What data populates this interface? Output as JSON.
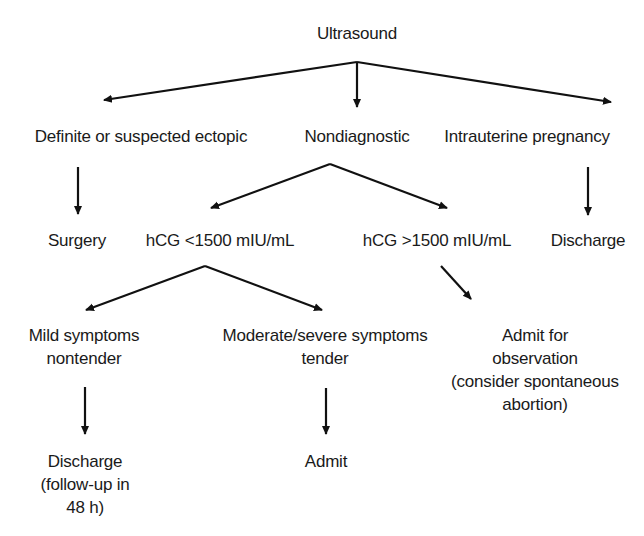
{
  "diagram": {
    "type": "flowchart",
    "nodes": {
      "ultrasound": {
        "label": "Ultrasound"
      },
      "ectopic": {
        "label": "Definite or suspected ectopic"
      },
      "nondiagnostic": {
        "label": "Nondiagnostic"
      },
      "intrauterine": {
        "label": "Intrauterine pregnancy"
      },
      "surgery": {
        "label": "Surgery"
      },
      "hcg_low": {
        "label": "hCG <1500 mIU/mL"
      },
      "hcg_high": {
        "label": "hCG >1500 mIU/mL"
      },
      "discharge_iup": {
        "label": "Discharge"
      },
      "mild": {
        "lines": [
          "Mild symptoms",
          "nontender"
        ]
      },
      "moderate": {
        "lines": [
          "Moderate/severe symptoms",
          "tender"
        ]
      },
      "admit_obs": {
        "lines": [
          "Admit for",
          "observation",
          "(consider spontaneous",
          "abortion)"
        ]
      },
      "discharge_followup": {
        "lines": [
          "Discharge",
          "(follow-up in",
          "48 h)"
        ]
      },
      "admit": {
        "label": "Admit"
      }
    },
    "edges": [
      [
        "Ultrasound",
        "Definite or suspected ectopic"
      ],
      [
        "Ultrasound",
        "Nondiagnostic"
      ],
      [
        "Ultrasound",
        "Intrauterine pregnancy"
      ],
      [
        "Definite or suspected ectopic",
        "Surgery"
      ],
      [
        "Nondiagnostic",
        "hCG <1500 mIU/mL"
      ],
      [
        "Nondiagnostic",
        "hCG >1500 mIU/mL"
      ],
      [
        "Intrauterine pregnancy",
        "Discharge"
      ],
      [
        "hCG <1500 mIU/mL",
        "Mild symptoms nontender"
      ],
      [
        "hCG <1500 mIU/mL",
        "Moderate/severe symptoms tender"
      ],
      [
        "hCG >1500 mIU/mL",
        "Admit for observation (consider spontaneous abortion)"
      ],
      [
        "Mild symptoms nontender",
        "Discharge (follow-up in 48 h)"
      ],
      [
        "Moderate/severe symptoms tender",
        "Admit"
      ]
    ],
    "colors": {
      "line": "#111111",
      "text": "#1a1a1a",
      "background": "#ffffff"
    }
  }
}
